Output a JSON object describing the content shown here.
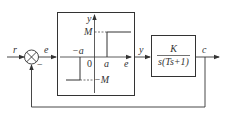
{
  "diagram": {
    "type": "block-diagram",
    "signals": {
      "input": "r",
      "error": "e",
      "nonlinear_output": "y",
      "output": "c",
      "feedback_sign": "−"
    },
    "nonlinear_block": {
      "name": "dead-zone relay",
      "axis_y": "y",
      "axis_x": "e",
      "origin": "0",
      "upper_level": "M",
      "lower_level": "−M",
      "positive_threshold": "a",
      "negative_threshold": "−a"
    },
    "plant_block": {
      "numerator": "K",
      "denominator": "s(Ts+1)"
    },
    "colors": {
      "line": "#333333",
      "background": "#ffffff"
    }
  }
}
